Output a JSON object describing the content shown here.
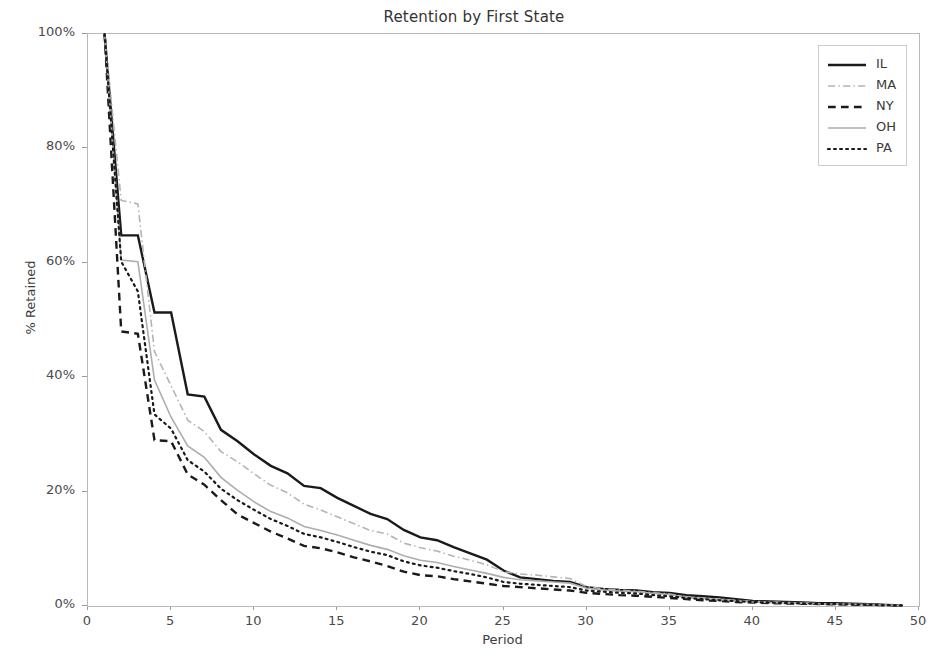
{
  "chart_data": {
    "type": "line",
    "title": "Retention by First State",
    "xlabel": "Period",
    "ylabel": "% Retained",
    "xlim": [
      0,
      50
    ],
    "ylim": [
      0,
      100
    ],
    "xticks": [
      0,
      5,
      10,
      15,
      20,
      25,
      30,
      35,
      40,
      45,
      50
    ],
    "xtick_labels": [
      "0",
      "5",
      "10",
      "15",
      "20",
      "25",
      "30",
      "35",
      "40",
      "45",
      "50"
    ],
    "yticks": [
      0,
      20,
      40,
      60,
      80,
      100
    ],
    "ytick_labels": [
      "0%",
      "20%",
      "40%",
      "60%",
      "80%",
      "100%"
    ],
    "grid": false,
    "legend_position": "upper right",
    "x": [
      1,
      2,
      3,
      4,
      5,
      6,
      7,
      8,
      9,
      10,
      11,
      12,
      13,
      14,
      15,
      16,
      17,
      18,
      19,
      20,
      21,
      22,
      23,
      24,
      25,
      26,
      27,
      28,
      29,
      30,
      31,
      32,
      33,
      34,
      35,
      36,
      37,
      38,
      39,
      40,
      41,
      42,
      43,
      44,
      45,
      46,
      47,
      48,
      49
    ],
    "series": [
      {
        "name": "IL",
        "color": "#1a1a1a",
        "linestyle": "solid",
        "linewidth": 2.4,
        "values": [
          100,
          64.8,
          64.8,
          51.3,
          51.3,
          37.0,
          36.6,
          30.8,
          28.8,
          26.5,
          24.5,
          23.2,
          21.0,
          20.6,
          18.9,
          17.5,
          16.1,
          15.2,
          13.3,
          12.0,
          11.5,
          10.3,
          9.2,
          8.1,
          6.2,
          5.0,
          4.7,
          4.4,
          4.2,
          3.3,
          3.0,
          2.8,
          2.7,
          2.4,
          2.3,
          1.9,
          1.7,
          1.5,
          1.2,
          0.9,
          0.8,
          0.7,
          0.6,
          0.5,
          0.5,
          0.4,
          0.3,
          0.2,
          0.1
        ]
      },
      {
        "name": "MA",
        "color": "#b4b4b4",
        "linestyle": "dashdot",
        "linewidth": 1.6,
        "values": [
          100,
          70.9,
          70.3,
          44.5,
          38.5,
          32.5,
          30.5,
          27.0,
          25.2,
          23.1,
          21.1,
          19.8,
          17.8,
          16.8,
          15.6,
          14.4,
          13.2,
          12.6,
          11.0,
          10.2,
          9.6,
          8.7,
          8.0,
          7.2,
          6.0,
          5.6,
          5.4,
          5.1,
          4.8,
          3.4,
          3.0,
          2.8,
          2.6,
          2.3,
          2.1,
          1.6,
          1.4,
          1.2,
          1.0,
          0.8,
          0.7,
          0.6,
          0.5,
          0.4,
          0.4,
          0.3,
          0.25,
          0.15,
          0.1
        ]
      },
      {
        "name": "NY",
        "color": "#1a1a1a",
        "linestyle": "dashed",
        "linewidth": 2.4,
        "values": [
          100,
          48.0,
          47.6,
          29.0,
          28.8,
          23.0,
          21.2,
          18.5,
          16.0,
          14.5,
          13.0,
          11.8,
          10.5,
          10.1,
          9.4,
          8.5,
          7.8,
          7.0,
          6.0,
          5.4,
          5.2,
          4.7,
          4.3,
          3.9,
          3.5,
          3.3,
          3.1,
          2.9,
          2.7,
          2.3,
          2.1,
          1.9,
          1.8,
          1.6,
          1.4,
          1.2,
          1.0,
          0.9,
          0.7,
          0.6,
          0.5,
          0.45,
          0.4,
          0.35,
          0.3,
          0.25,
          0.2,
          0.15,
          0.1
        ]
      },
      {
        "name": "OH",
        "color": "#adadad",
        "linestyle": "solid",
        "linewidth": 1.6,
        "values": [
          100,
          60.5,
          60.2,
          39.5,
          33.0,
          28.0,
          26.0,
          22.5,
          20.2,
          18.2,
          16.5,
          15.4,
          13.9,
          13.2,
          12.4,
          11.5,
          10.6,
          9.9,
          8.8,
          8.0,
          7.6,
          6.9,
          6.3,
          5.7,
          5.0,
          4.6,
          4.4,
          4.2,
          4.0,
          3.1,
          2.8,
          2.6,
          2.5,
          2.2,
          2.0,
          1.5,
          1.3,
          1.1,
          0.9,
          0.7,
          0.6,
          0.55,
          0.5,
          0.4,
          0.35,
          0.3,
          0.25,
          0.15,
          0.1
        ]
      },
      {
        "name": "PA",
        "color": "#1a1a1a",
        "linestyle": "dotted",
        "linewidth": 2.2,
        "values": [
          100,
          60.2,
          55.0,
          33.5,
          31.0,
          25.5,
          23.5,
          20.5,
          18.5,
          16.8,
          15.2,
          14.0,
          12.6,
          12.0,
          11.2,
          10.3,
          9.5,
          8.9,
          7.8,
          7.1,
          6.7,
          6.1,
          5.6,
          5.0,
          4.2,
          3.9,
          3.7,
          3.5,
          3.3,
          2.7,
          2.5,
          2.3,
          2.2,
          1.9,
          1.7,
          1.4,
          1.2,
          1.0,
          0.85,
          0.7,
          0.6,
          0.5,
          0.45,
          0.38,
          0.32,
          0.27,
          0.22,
          0.15,
          0.1
        ]
      }
    ]
  }
}
